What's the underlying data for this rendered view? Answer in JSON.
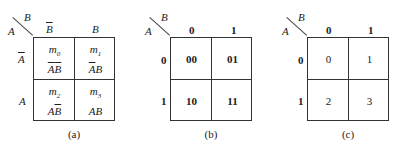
{
  "maps": [
    {
      "id": "a",
      "row_var": "A",
      "col_var": "B",
      "col_headers": [
        {
          "text": "B",
          "overline": true
        },
        {
          "text": "B",
          "overline": false
        }
      ],
      "row_headers": [
        {
          "text": "A",
          "overline": true
        },
        {
          "text": "A",
          "overline": false
        }
      ],
      "cells": [
        {
          "minterm": "m",
          "index": "0",
          "term": [
            {
              "t": "A",
              "o": true
            },
            {
              "t": "B",
              "o": true
            }
          ]
        },
        {
          "minterm": "m",
          "index": "1",
          "term": [
            {
              "t": "A",
              "o": true
            },
            {
              "t": "B",
              "o": false
            }
          ]
        },
        {
          "minterm": "m",
          "index": "2",
          "term": [
            {
              "t": "A",
              "o": false
            },
            {
              "t": "B",
              "o": true
            }
          ]
        },
        {
          "minterm": "m",
          "index": "3",
          "term": [
            {
              "t": "A",
              "o": false
            },
            {
              "t": "B",
              "o": false
            }
          ]
        }
      ],
      "caption": "(a)"
    },
    {
      "id": "b",
      "row_var": "A",
      "col_var": "B",
      "col_headers": [
        "0",
        "1"
      ],
      "row_headers": [
        "0",
        "1"
      ],
      "cells": [
        "00",
        "01",
        "10",
        "11"
      ],
      "caption": "(b)"
    },
    {
      "id": "c",
      "row_var": "A",
      "col_var": "B",
      "col_headers": [
        "0",
        "1"
      ],
      "row_headers": [
        "0",
        "1"
      ],
      "cells": [
        "0",
        "1",
        "2",
        "3"
      ],
      "caption": "(c)"
    }
  ]
}
